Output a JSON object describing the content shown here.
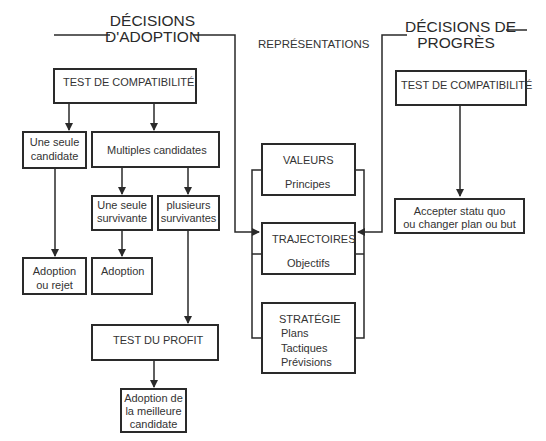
{
  "headings": {
    "adoption_line1": "DÉCISIONS",
    "adoption_line2": "D'ADOPTION",
    "representations": "REPRÉSENTATIONS",
    "progress_line1": "DÉCISIONS DE",
    "progress_line2": "PROGRÈS"
  },
  "adoption": {
    "compat_test": "TEST DE COMPATIBILITÉ",
    "single_candidate_1": "Une seule",
    "single_candidate_2": "candidate",
    "multiple_candidates": "Multiples candidates",
    "single_survivor_1": "Une seule",
    "single_survivor_2": "survivante",
    "several_survivors_1": "plusieurs",
    "several_survivors_2": "survivantes",
    "adopt_or_reject_1": "Adoption",
    "adopt_or_reject_2": "ou rejet",
    "adoption": "Adoption",
    "profit_test": "TEST DU PROFIT",
    "best_adoption_1": "Adoption de",
    "best_adoption_2": "la meilleure",
    "best_adoption_3": "candidate"
  },
  "representations": {
    "values_title": "VALEURS",
    "values_sub": "Principes",
    "trajectories_title": "TRAJECTOIRES",
    "trajectories_sub": "Objectifs",
    "strategy_title": "STRATÉGIE",
    "strategy_items": [
      "Plans",
      "Tactiques",
      "Prévisions"
    ]
  },
  "progress": {
    "compat_test": "TEST DE COMPATIBILITÉ",
    "outcome_1": "Accepter statu quo",
    "outcome_2": "ou changer plan ou but"
  }
}
